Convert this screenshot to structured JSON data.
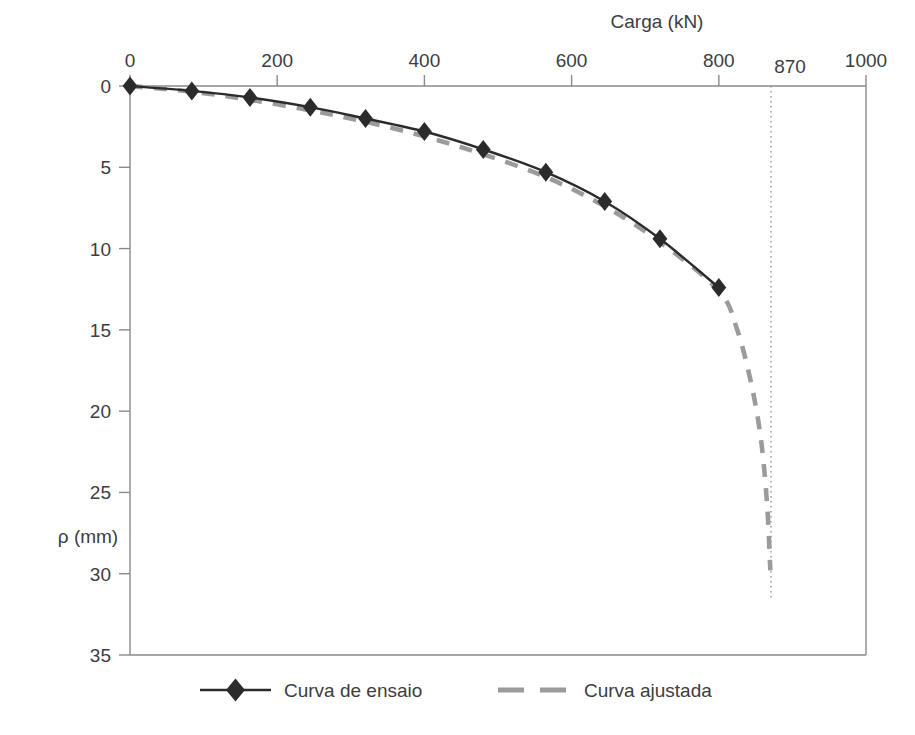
{
  "figure": {
    "background_color": "#ffffff",
    "frame_color": "#8a8a8a",
    "series_test_color": "#2b2b2b",
    "series_fit_color": "#9b9b9b",
    "asymptote_color": "#8a8a8a"
  },
  "axes": {
    "x_title": "Carga (kN)",
    "x_title_position": "top",
    "x_ticks": [
      "0",
      "200",
      "400",
      "600",
      "800",
      "1000"
    ],
    "x_tick_values": [
      0,
      200,
      400,
      600,
      800,
      1000
    ],
    "x_special_tick": "870",
    "x_special_tick_value": 870,
    "y_title": "ρ (mm)",
    "y_ticks": [
      "0",
      "5",
      "10",
      "15",
      "20",
      "25",
      "30",
      "35"
    ],
    "y_tick_values": [
      0,
      5,
      10,
      15,
      20,
      25,
      30,
      35
    ]
  },
  "legend": {
    "items": [
      {
        "label": "Curva de ensaio",
        "style": "solid-line-with-diamond-marker",
        "color": "#2b2b2b"
      },
      {
        "label": "Curva ajustada",
        "style": "dashed-line",
        "color": "#9b9b9b"
      }
    ]
  },
  "chart_data": {
    "type": "line",
    "title": "",
    "subtitle": "",
    "xlabel": "Carga (kN)",
    "ylabel": "ρ (mm)",
    "xlim": [
      0,
      1000
    ],
    "ylim": [
      0,
      35
    ],
    "y_axis_inverted": true,
    "x_axis_position": "top",
    "grid": false,
    "legend_position": "bottom",
    "annotations": [
      {
        "type": "vertical-asymptote",
        "label": "870",
        "x": 870,
        "style": "dotted",
        "note": "carga última assintótica"
      }
    ],
    "series": [
      {
        "name": "Curva de ensaio",
        "style": "solid",
        "marker": "diamond",
        "color": "#2b2b2b",
        "x": [
          0,
          84,
          163,
          245,
          320,
          400,
          480,
          565,
          645,
          720,
          800
        ],
        "y": [
          0.0,
          0.3,
          0.7,
          1.3,
          2.0,
          2.8,
          3.9,
          5.3,
          7.1,
          9.4,
          12.4
        ]
      },
      {
        "name": "Curva ajustada",
        "style": "dashed",
        "marker": "none",
        "color": "#9b9b9b",
        "x": [
          0,
          84,
          163,
          245,
          320,
          400,
          480,
          565,
          645,
          720,
          800,
          825,
          845,
          858,
          866,
          870
        ],
        "y": [
          0.0,
          0.35,
          0.85,
          1.5,
          2.2,
          3.1,
          4.2,
          5.6,
          7.4,
          9.6,
          12.6,
          15.0,
          18.5,
          22.0,
          26.0,
          29.8
        ]
      }
    ]
  }
}
